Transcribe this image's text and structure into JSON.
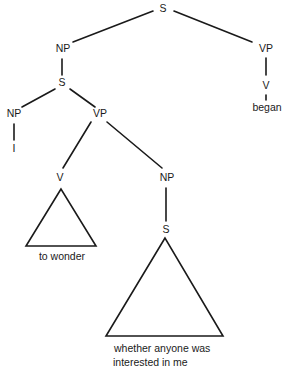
{
  "diagram": {
    "type": "syntax-tree",
    "nodes": {
      "root_s": "S",
      "subject_np": "NP",
      "main_vp": "VP",
      "main_v": "V",
      "main_verb": "began",
      "embedded_s": "S",
      "embedded_np": "NP",
      "pronoun": "I",
      "embedded_vp": "VP",
      "embedded_v": "V",
      "v_phrase": "to wonder",
      "object_np": "NP",
      "object_s": "S",
      "clause_line1": "whether anyone was",
      "clause_line2": "interested in me"
    },
    "edges": [
      [
        "S",
        "NP"
      ],
      [
        "S",
        "VP"
      ],
      [
        "VP",
        "V"
      ],
      [
        "V",
        "began"
      ],
      [
        "NP",
        "S"
      ],
      [
        "S",
        "NP"
      ],
      [
        "S",
        "VP"
      ],
      [
        "NP",
        "I"
      ],
      [
        "VP",
        "V"
      ],
      [
        "VP",
        "NP"
      ],
      [
        "V",
        "to wonder (triangle)"
      ],
      [
        "NP",
        "S"
      ],
      [
        "S",
        "whether anyone was interested in me (triangle)"
      ]
    ]
  }
}
